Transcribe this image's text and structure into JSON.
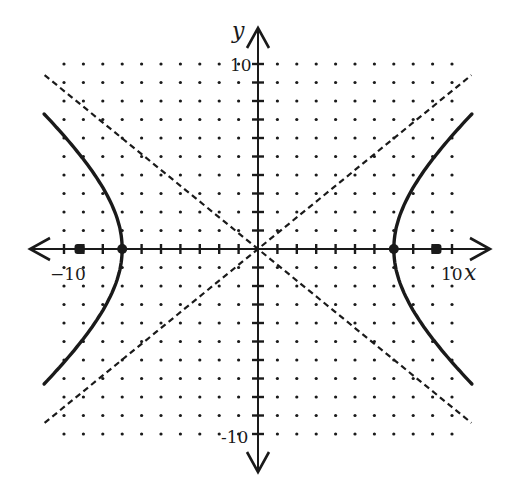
{
  "chart_data": {
    "type": "line",
    "title": "",
    "xlabel": "x",
    "ylabel": "y",
    "xlim": [
      -10,
      10
    ],
    "ylim": [
      -10,
      10
    ],
    "grid": "dot-grid at integer points",
    "tick_labels": {
      "x_neg": "−10",
      "x_pos": "10",
      "y_pos": "10",
      "y_neg": "-10"
    },
    "equation": "x^2/49 - y^2/36 = 1",
    "series": [
      {
        "name": "hyperbola-right-branch",
        "style": "solid",
        "points": [
          [
            11.0,
            7.3
          ],
          [
            9.0,
            4.4
          ],
          [
            8.0,
            2.9
          ],
          [
            7.0,
            0
          ],
          [
            8.0,
            -2.9
          ],
          [
            9.0,
            -4.4
          ],
          [
            11.0,
            -7.3
          ]
        ]
      },
      {
        "name": "hyperbola-left-branch",
        "style": "solid",
        "points": [
          [
            -11.0,
            7.3
          ],
          [
            -9.0,
            4.4
          ],
          [
            -8.0,
            2.9
          ],
          [
            -7.0,
            0
          ],
          [
            -8.0,
            -2.9
          ],
          [
            -9.0,
            -4.4
          ],
          [
            -11.0,
            -7.3
          ]
        ]
      },
      {
        "name": "asymptote-positive",
        "style": "dashed",
        "equation": "y = (6/7)x",
        "points": [
          [
            -11,
            -9.4
          ],
          [
            11,
            9.4
          ]
        ]
      },
      {
        "name": "asymptote-negative",
        "style": "dashed",
        "equation": "y = -(6/7)x",
        "points": [
          [
            -11,
            9.4
          ],
          [
            11,
            -9.4
          ]
        ]
      }
    ],
    "marked_points": {
      "vertices": [
        [
          -7,
          0
        ],
        [
          7,
          0
        ]
      ],
      "foci": [
        [
          -9.2,
          0
        ],
        [
          9.2,
          0
        ]
      ]
    }
  },
  "labels": {
    "x_axis": "x",
    "y_axis": "y",
    "x_neg_tick": "−10",
    "x_pos_tick": "10",
    "y_pos_tick": "10",
    "y_neg_tick": "-10"
  }
}
